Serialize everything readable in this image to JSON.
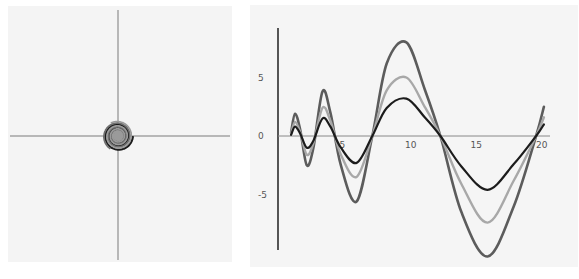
{
  "chart_data": [
    {
      "type": "line",
      "title": "",
      "description": "Three interleaved spirals centered on crossing axes",
      "xlabel": "",
      "ylabel": "",
      "grid": false,
      "axes": {
        "cross_at": [
          0,
          0
        ],
        "ticks": false
      },
      "series": [
        {
          "name": "spiral-black",
          "color": "#1a1a1a",
          "width": 2.2,
          "phase_deg": 0
        },
        {
          "name": "spiral-gray",
          "color": "#6e6e6e",
          "width": 1.8,
          "phase_deg": 120
        },
        {
          "name": "spiral-light",
          "color": "#9a9a9a",
          "width": 1.6,
          "phase_deg": 240
        }
      ],
      "spiral": {
        "type": "logarithmic",
        "growth_per_turn": 1.42,
        "turns": 7
      }
    },
    {
      "type": "line",
      "title": "",
      "xlabel": "",
      "ylabel": "",
      "grid": false,
      "xlim": [
        0,
        20.8
      ],
      "ylim": [
        -11,
        10
      ],
      "x_ticks": [
        5,
        10,
        15,
        20
      ],
      "x_tick_labels": [
        "5",
        "10",
        "15",
        "20"
      ],
      "y_ticks": [
        5,
        0,
        -5
      ],
      "y_tick_labels": [
        "5",
        "0",
        "-5"
      ],
      "x": [
        1.0,
        1.3,
        1.7,
        2.2,
        2.7,
        3.4,
        4.0,
        4.8,
        6.0,
        7.2,
        8.3,
        9.8,
        11.2,
        12.4,
        14.0,
        16.0,
        18.0,
        19.7,
        20.3
      ],
      "series": [
        {
          "name": "outer",
          "color": "#5c5c5c",
          "width": 2.6,
          "values": [
            0.3,
            1.9,
            0.5,
            -2.5,
            -1.0,
            3.8,
            2.0,
            -2.5,
            -5.6,
            0.0,
            6.2,
            8.0,
            4.0,
            0.0,
            -6.5,
            -10.3,
            -6.0,
            0.0,
            2.5
          ]
        },
        {
          "name": "middle",
          "color": "#a8a8a8",
          "width": 2.4,
          "values": [
            0.2,
            1.2,
            0.3,
            -1.6,
            -0.6,
            2.4,
            1.3,
            -1.6,
            -3.5,
            0.0,
            3.9,
            5.0,
            2.5,
            0.0,
            -4.1,
            -7.4,
            -3.8,
            0.0,
            1.6
          ]
        },
        {
          "name": "inner",
          "color": "#1c1c1c",
          "width": 2.2,
          "values": [
            0.1,
            0.8,
            0.2,
            -1.0,
            -0.4,
            1.5,
            0.8,
            -1.0,
            -2.3,
            0.0,
            2.4,
            3.2,
            1.6,
            0.0,
            -2.6,
            -4.6,
            -2.4,
            0.0,
            1.0
          ]
        }
      ]
    }
  ]
}
